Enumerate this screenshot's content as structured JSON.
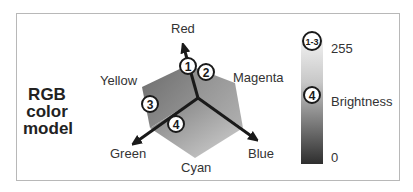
{
  "title": {
    "line1": "RGB",
    "line2": "color",
    "line3": "model"
  },
  "cube": {
    "vertices": {
      "red": "Red",
      "yellow": "Yellow",
      "magenta": "Magenta",
      "green": "Green",
      "cyan": "Cyan",
      "blue": "Blue"
    },
    "markers": [
      "1",
      "2",
      "3",
      "4"
    ]
  },
  "brightness_bar": {
    "top_marker": "1-3",
    "mid_marker": "4",
    "max_label": "255",
    "axis_label": "Brightness",
    "min_label": "0"
  },
  "colors": {
    "arrow": "#1a1a1a",
    "border": "#b8b8b8"
  }
}
